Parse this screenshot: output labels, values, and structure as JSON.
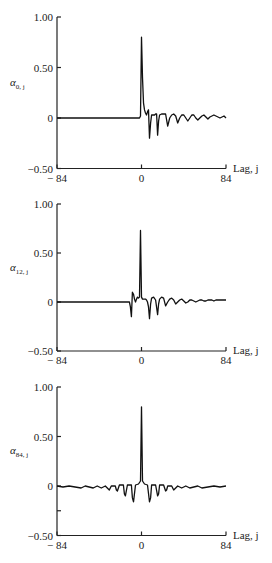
{
  "chart_data": [
    {
      "type": "line",
      "title": "",
      "ylabel": "α0,j",
      "ylabel_main": "α",
      "ylabel_sub": "0, j",
      "xlabel": "Lag, j",
      "xlim": [
        -84,
        84
      ],
      "ylim": [
        -0.5,
        1.0
      ],
      "xticks": [
        "-84",
        "0",
        "84"
      ],
      "yticks": [
        "1.00",
        "0.50",
        "0",
        "-0.50"
      ],
      "grid": false,
      "x": [
        -84,
        -60,
        -30,
        -10,
        -2,
        -1,
        0,
        1,
        2,
        3,
        4,
        5,
        6,
        7,
        8,
        9,
        10,
        11,
        12,
        13,
        14,
        15,
        16,
        17,
        18,
        20,
        22,
        24,
        26,
        28,
        30,
        32,
        34,
        36,
        38,
        40,
        42,
        44,
        46,
        48,
        50,
        52,
        54,
        56,
        58,
        60,
        62,
        64,
        66,
        68,
        70,
        72,
        74,
        76,
        78,
        80,
        82,
        84
      ],
      "values": [
        0,
        0,
        0,
        0,
        0,
        0.02,
        0.8,
        0.4,
        0.15,
        0.08,
        0.05,
        0.03,
        0.06,
        0.08,
        -0.2,
        -0.05,
        0.03,
        0.03,
        0.03,
        0.03,
        0.04,
        0.04,
        -0.17,
        -0.03,
        0.03,
        0.04,
        0.04,
        0.04,
        -0.08,
        0.0,
        0.03,
        0.04,
        0.02,
        -0.05,
        0.0,
        0.03,
        0.03,
        0.0,
        -0.03,
        0.0,
        0.03,
        0.03,
        0.0,
        -0.02,
        0.0,
        0.02,
        0.03,
        0.01,
        -0.01,
        0.01,
        0.02,
        0.03,
        0.02,
        0.01,
        0.0,
        0.01,
        0.02,
        0.0
      ]
    },
    {
      "type": "line",
      "title": "",
      "ylabel": "α12,j",
      "ylabel_main": "α",
      "ylabel_sub": "12, j",
      "xlabel": "Lag, j",
      "xlim": [
        -84,
        84
      ],
      "ylim": [
        -0.5,
        1.0
      ],
      "xticks": [
        "-84",
        "0",
        "84"
      ],
      "yticks": [
        "1.00",
        "0.50",
        "0",
        "-0.50"
      ],
      "grid": false,
      "x": [
        -84,
        -60,
        -30,
        -14,
        -12,
        -11,
        -10,
        -9,
        -8,
        -7,
        -6,
        -5,
        -4,
        -3,
        -2,
        -1,
        0,
        1,
        2,
        3,
        4,
        5,
        6,
        7,
        8,
        9,
        10,
        12,
        14,
        16,
        17,
        18,
        20,
        22,
        24,
        26,
        28,
        30,
        32,
        34,
        36,
        38,
        40,
        42,
        44,
        46,
        48,
        50,
        52,
        54,
        56,
        58,
        60,
        62,
        64,
        66,
        68,
        70,
        72,
        74,
        76,
        78,
        80,
        82,
        84
      ],
      "values": [
        0,
        0,
        0,
        0,
        0,
        -0.05,
        -0.15,
        0.1,
        0.08,
        0.03,
        0.0,
        0.03,
        0.05,
        0.04,
        0.05,
        0.73,
        0.05,
        0.03,
        0.03,
        0.03,
        0.03,
        0.02,
        0.0,
        -0.05,
        -0.17,
        -0.02,
        0.04,
        0.05,
        0.02,
        -0.13,
        -0.02,
        0.03,
        0.05,
        0.04,
        -0.04,
        0.0,
        0.03,
        0.04,
        0.02,
        -0.02,
        0.0,
        0.02,
        0.03,
        0.01,
        -0.01,
        0.0,
        0.02,
        0.02,
        0.01,
        0.0,
        0.01,
        0.02,
        0.02,
        0.01,
        0.01,
        0.02,
        0.02,
        0.02,
        0.01,
        0.02,
        0.02,
        0.02,
        0.02,
        0.02,
        0.02
      ]
    },
    {
      "type": "line",
      "title": "",
      "ylabel": "α84,j",
      "ylabel_main": "α",
      "ylabel_sub": "84, j",
      "xlabel": "Lag, j",
      "xlim": [
        -84,
        84
      ],
      "ylim": [
        -0.5,
        1.0
      ],
      "xticks": [
        "-84",
        "0",
        "84"
      ],
      "yticks": [
        "1.00",
        "0.50",
        "0",
        "-0.50"
      ],
      "minor_yticks": [
        -0.25
      ],
      "grid": false,
      "x": [
        -84,
        -78,
        -72,
        -66,
        -60,
        -56,
        -52,
        -48,
        -44,
        -40,
        -36,
        -33,
        -32,
        -30,
        -26,
        -25,
        -24,
        -22,
        -18,
        -17,
        -16,
        -14,
        -10,
        -9,
        -8,
        -6,
        -3,
        -1,
        0,
        1,
        3,
        6,
        8,
        9,
        10,
        14,
        16,
        17,
        18,
        22,
        24,
        25,
        26,
        30,
        32,
        33,
        36,
        40,
        44,
        48,
        52,
        56,
        60,
        66,
        72,
        78,
        84
      ],
      "values": [
        0,
        -0.01,
        0,
        -0.01,
        -0.02,
        0,
        -0.01,
        -0.02,
        0,
        -0.02,
        0,
        -0.03,
        -0.04,
        0,
        0,
        -0.04,
        -0.05,
        0.01,
        0.01,
        -0.08,
        -0.1,
        0.01,
        0.01,
        -0.12,
        -0.16,
        0.01,
        0.02,
        0.05,
        0.8,
        0.05,
        0.02,
        0.01,
        -0.16,
        -0.12,
        0.01,
        0.01,
        -0.1,
        -0.08,
        0.01,
        0.01,
        -0.05,
        -0.04,
        0,
        0,
        -0.04,
        -0.03,
        0,
        -0.02,
        0,
        -0.02,
        -0.01,
        0,
        -0.02,
        -0.01,
        0,
        -0.01,
        0
      ]
    }
  ]
}
